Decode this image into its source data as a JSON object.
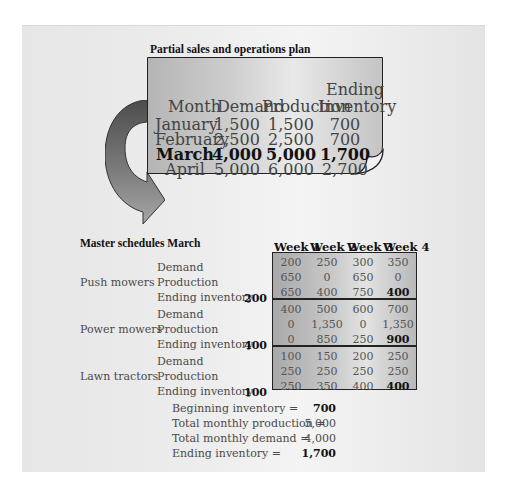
{
  "plan": {
    "title": "Partial sales and operations plan",
    "headers": {
      "month": "Month",
      "demand": "Demand",
      "production": "Production",
      "ending_top": "Ending",
      "ending_bottom": "Inventory"
    },
    "rows": [
      {
        "month": "January",
        "demand": "1,500",
        "production": "1,500",
        "ending": "700",
        "bold": false
      },
      {
        "month": "February",
        "demand": "2,500",
        "production": "2,500",
        "ending": "700",
        "bold": false
      },
      {
        "month": "March",
        "demand": "4,000",
        "production": "5,000",
        "ending": "1,700",
        "bold": true
      },
      {
        "month": "April",
        "demand": "5,000",
        "production": "6,000",
        "ending": "2,700",
        "bold": false
      }
    ]
  },
  "master": {
    "title": "Master schedules March",
    "weeks": [
      "Week 1",
      "Week 2",
      "Week 3",
      "Week 4"
    ],
    "row_labels": [
      "Demand",
      "Production",
      "Ending inventory"
    ],
    "products": [
      {
        "name": "Push mowers",
        "beginning": "200",
        "demand": [
          "200",
          "250",
          "300",
          "350"
        ],
        "production": [
          "650",
          "0",
          "650",
          "0"
        ],
        "ending": [
          "650",
          "400",
          "750",
          "400"
        ]
      },
      {
        "name": "Power mowers",
        "beginning": "400",
        "demand": [
          "400",
          "500",
          "600",
          "700"
        ],
        "production": [
          "0",
          "1,350",
          "0",
          "1,350"
        ],
        "ending": [
          "0",
          "850",
          "250",
          "900"
        ]
      },
      {
        "name": "Lawn tractors",
        "beginning": "100",
        "demand": [
          "100",
          "150",
          "200",
          "250"
        ],
        "production": [
          "250",
          "250",
          "250",
          "250"
        ],
        "ending": [
          "250",
          "350",
          "400",
          "400"
        ]
      }
    ]
  },
  "summary": [
    {
      "label": "Beginning inventory =",
      "value": "700",
      "bold": true
    },
    {
      "label": "Total monthly production =",
      "value": "5,000",
      "bold": false
    },
    {
      "label": "Total monthly demand =",
      "value": "4,000",
      "bold": false
    },
    {
      "label": "Ending inventory =",
      "value": "1,700",
      "bold": true
    }
  ],
  "colors": {
    "arrow_dark": "#5a5a5a",
    "arrow_light": "#9a9a9a",
    "border": "#222222"
  }
}
